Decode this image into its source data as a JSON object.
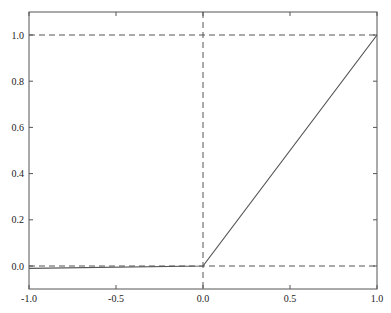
{
  "chart_data": {
    "type": "line",
    "title": "",
    "xlabel": "",
    "ylabel": "",
    "xlim": [
      -1.0,
      1.0
    ],
    "ylim": [
      -0.1,
      1.1
    ],
    "grid": false,
    "legend": null,
    "x_ticks": [
      "-1.0",
      "-0.5",
      "0.0",
      "0.5",
      "1.0"
    ],
    "y_ticks": [
      "0.0",
      "0.2",
      "0.4",
      "0.6",
      "0.8",
      "1.0"
    ],
    "series": [
      {
        "name": "activation",
        "style": "solid",
        "color": "#555555",
        "x": [
          -1.0,
          0.0,
          1.0
        ],
        "y": [
          -0.01,
          0.0,
          1.0
        ]
      }
    ],
    "reference_lines": [
      {
        "orientation": "horizontal",
        "value": 0.0,
        "style": "dashed"
      },
      {
        "orientation": "horizontal",
        "value": 1.0,
        "style": "dashed"
      },
      {
        "orientation": "vertical",
        "value": 0.0,
        "style": "dashed"
      }
    ]
  }
}
